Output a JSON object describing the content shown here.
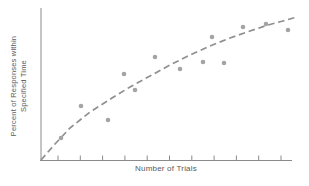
{
  "chart_data": {
    "type": "scatter",
    "title": "",
    "xlabel": "Number of Trials",
    "ylabel_lines": [
      "Percent of Responses within",
      "Specified Time"
    ],
    "grid": false,
    "legend": "none",
    "x_axis": {
      "numeric_labels_shown": false,
      "tick_count": 11,
      "ticks_px": [
        58,
        80.3,
        102.6,
        124.9,
        147.2,
        169.5,
        191.8,
        214.1,
        236.4,
        258.7,
        281
      ]
    },
    "y_axis": {
      "numeric_labels_shown": false,
      "implied_scale": "percent increasing upward"
    },
    "frame_px": {
      "origin_x": 41,
      "origin_y": 160.5,
      "x_end": 292,
      "y_top": 8,
      "tick_len": 5
    },
    "points_px": [
      [
        61,
        138
      ],
      [
        81,
        106
      ],
      [
        108,
        120
      ],
      [
        124,
        74
      ],
      [
        135,
        90
      ],
      [
        155,
        57
      ],
      [
        180,
        69
      ],
      [
        203,
        62
      ],
      [
        212,
        37
      ],
      [
        224,
        63
      ],
      [
        243,
        27
      ],
      [
        266,
        24
      ],
      [
        288,
        30
      ]
    ],
    "points_norm": [
      {
        "x_frac": 0.08,
        "y_pct": 15
      },
      {
        "x_frac": 0.16,
        "y_pct": 36
      },
      {
        "x_frac": 0.27,
        "y_pct": 27
      },
      {
        "x_frac": 0.33,
        "y_pct": 57
      },
      {
        "x_frac": 0.37,
        "y_pct": 46
      },
      {
        "x_frac": 0.45,
        "y_pct": 68
      },
      {
        "x_frac": 0.55,
        "y_pct": 60
      },
      {
        "x_frac": 0.65,
        "y_pct": 65
      },
      {
        "x_frac": 0.68,
        "y_pct": 81
      },
      {
        "x_frac": 0.73,
        "y_pct": 64
      },
      {
        "x_frac": 0.8,
        "y_pct": 88
      },
      {
        "x_frac": 0.9,
        "y_pct": 90
      },
      {
        "x_frac": 0.98,
        "y_pct": 86
      }
    ],
    "trend_curve": {
      "style": "dashed",
      "shape": "concave-down learning curve",
      "points_px": [
        [
          41,
          160
        ],
        [
          55,
          144
        ],
        [
          70,
          128
        ],
        [
          90,
          112
        ],
        [
          112,
          98
        ],
        [
          130,
          87
        ],
        [
          150,
          76
        ],
        [
          170,
          65
        ],
        [
          190,
          55
        ],
        [
          210,
          46
        ],
        [
          230,
          38
        ],
        [
          250,
          31
        ],
        [
          268,
          25
        ],
        [
          283,
          21
        ],
        [
          297,
          17
        ]
      ]
    },
    "point_radius_px": 2.3,
    "colors": {
      "point": "#a4a4a4",
      "curve": "#8f8f8f",
      "axis": "#8a8a8a",
      "text": "#5a5a5a",
      "background": "#ffffff"
    }
  }
}
